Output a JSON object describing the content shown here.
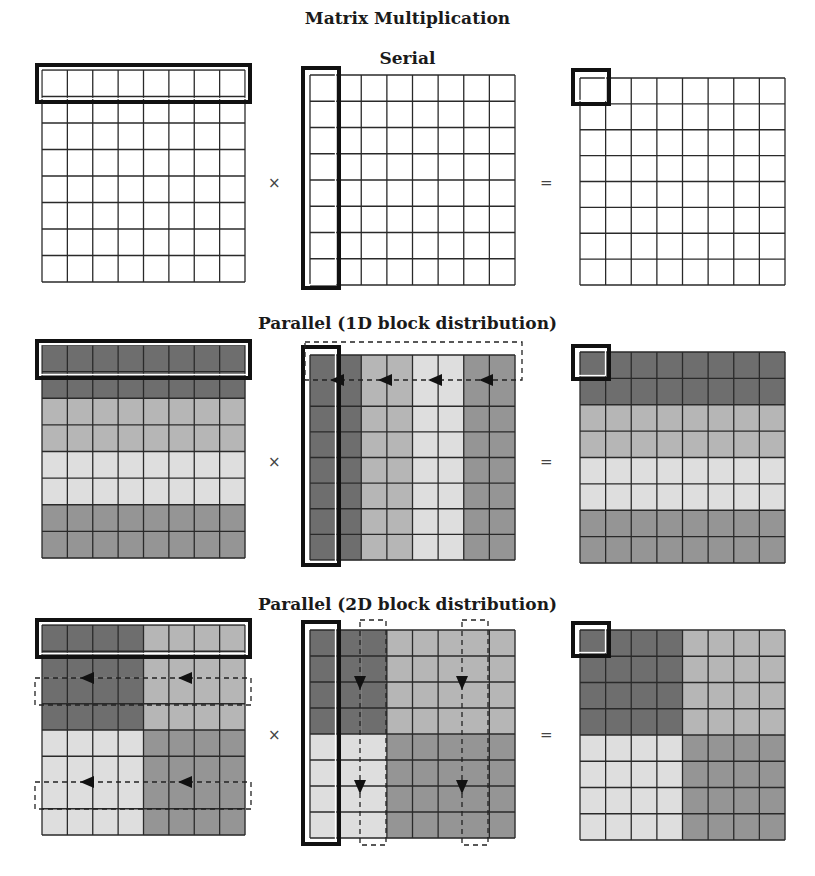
{
  "title": "Matrix Multiplication",
  "colors": {
    "grid_line": "#2a2a2a",
    "highlight": "#111111",
    "dashed": "#222222",
    "white": "#ffffff",
    "dark": "#6e6e6e",
    "mid": "#b6b6b6",
    "light": "#dedede",
    "midDark": "#959595"
  },
  "operators": {
    "times": "×",
    "equals": "="
  },
  "sections": [
    {
      "id": "serial",
      "title": "Serial",
      "title_top": 48,
      "op_y": 184,
      "matrices": [
        {
          "role": "A",
          "x": 42,
          "y": 70,
          "w": 203,
          "h": 212,
          "shade": "none",
          "highlight": {
            "x": 37,
            "y": 65,
            "w": 213,
            "h": 37
          },
          "hide_h": [],
          "hide_v": []
        },
        {
          "role": "B",
          "x": 310,
          "y": 75,
          "w": 205,
          "h": 210,
          "shade": "none",
          "highlight": {
            "x": 303,
            "y": 68,
            "w": 36,
            "h": 220
          },
          "hide_h": [],
          "hide_v": []
        },
        {
          "role": "C",
          "x": 580,
          "y": 78,
          "w": 205,
          "h": 207,
          "shade": "none",
          "highlight": {
            "x": 573,
            "y": 70,
            "w": 36,
            "h": 34
          },
          "hide_h": [],
          "hide_v": []
        }
      ],
      "dashed_boxes": [],
      "arrows": []
    },
    {
      "id": "parallel-1d",
      "title": "Parallel (1D block distribution)",
      "title_top": 313,
      "op_y": 463,
      "matrices": [
        {
          "role": "A",
          "x": 42,
          "y": 345,
          "w": 203,
          "h": 213,
          "shade": "rows1d",
          "highlight": {
            "x": 37,
            "y": 341,
            "w": 213,
            "h": 37
          },
          "hide_h": [],
          "hide_v": []
        },
        {
          "role": "B",
          "x": 310,
          "y": 355,
          "w": 205,
          "h": 205,
          "shade": "cols1d",
          "highlight": {
            "x": 303,
            "y": 347,
            "w": 36,
            "h": 218
          },
          "hide_h": [
            1
          ],
          "hide_v": []
        },
        {
          "role": "C",
          "x": 580,
          "y": 352,
          "w": 205,
          "h": 211,
          "shade": "rows1d",
          "highlight": {
            "x": 573,
            "y": 346,
            "w": 36,
            "h": 33
          },
          "hide_h": [],
          "hide_v": []
        }
      ],
      "dashed_boxes": [
        {
          "x": 305,
          "y": 342,
          "w": 217,
          "h": 38,
          "open": "none"
        }
      ],
      "arrows": [
        {
          "x": 338,
          "y": 380,
          "dir": "left"
        },
        {
          "x": 386,
          "y": 380,
          "dir": "left"
        },
        {
          "x": 436,
          "y": 380,
          "dir": "left"
        },
        {
          "x": 487,
          "y": 380,
          "dir": "left"
        }
      ]
    },
    {
      "id": "parallel-2d",
      "title": "Parallel (2D block distribution)",
      "title_top": 594,
      "op_y": 736,
      "matrices": [
        {
          "role": "A",
          "x": 42,
          "y": 625,
          "w": 203,
          "h": 210,
          "shade": "quad2dA",
          "highlight": {
            "x": 37,
            "y": 620,
            "w": 213,
            "h": 37
          },
          "hide_h": [
            2,
            6
          ],
          "hide_v": []
        },
        {
          "role": "B",
          "x": 310,
          "y": 630,
          "w": 205,
          "h": 208,
          "shade": "quad2dB",
          "highlight": {
            "x": 303,
            "y": 622,
            "w": 36,
            "h": 222
          },
          "hide_v": [
            2,
            6
          ],
          "hide_h": []
        },
        {
          "role": "C",
          "x": 580,
          "y": 630,
          "w": 205,
          "h": 210,
          "shade": "quad2dA",
          "highlight": {
            "x": 573,
            "y": 623,
            "w": 36,
            "h": 33
          },
          "hide_h": [],
          "hide_v": []
        }
      ],
      "dashed_boxes": [
        {
          "x": 35,
          "y": 678,
          "w": 216,
          "h": 27,
          "open": "none"
        },
        {
          "x": 35,
          "y": 782,
          "w": 216,
          "h": 27,
          "open": "none"
        },
        {
          "x": 360,
          "y": 620,
          "w": 26,
          "h": 225,
          "open": "none"
        },
        {
          "x": 462,
          "y": 620,
          "w": 26,
          "h": 225,
          "open": "none"
        }
      ],
      "arrows": [
        {
          "x": 88,
          "y": 678,
          "dir": "left"
        },
        {
          "x": 186,
          "y": 678,
          "dir": "left"
        },
        {
          "x": 88,
          "y": 782,
          "dir": "left"
        },
        {
          "x": 186,
          "y": 782,
          "dir": "left"
        },
        {
          "x": 360,
          "y": 682,
          "dir": "down"
        },
        {
          "x": 462,
          "y": 682,
          "dir": "down"
        },
        {
          "x": 360,
          "y": 786,
          "dir": "down"
        },
        {
          "x": 462,
          "y": 786,
          "dir": "down"
        }
      ]
    }
  ]
}
